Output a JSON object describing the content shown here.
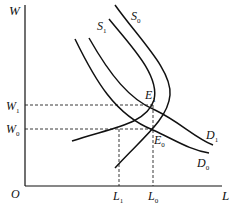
{
  "diagram": {
    "type": "supply-demand-labor-market",
    "axes": {
      "y_label": "W",
      "x_label": "L",
      "origin_label": "O"
    },
    "curves": [
      {
        "id": "S0",
        "label": "S",
        "sub": "0",
        "kind": "supply"
      },
      {
        "id": "S1",
        "label": "S",
        "sub": "1",
        "kind": "supply"
      },
      {
        "id": "D0",
        "label": "D",
        "sub": "0",
        "kind": "demand"
      },
      {
        "id": "D1",
        "label": "D",
        "sub": "1",
        "kind": "demand"
      }
    ],
    "equilibria": [
      {
        "id": "E0",
        "label": "E",
        "sub": "0"
      },
      {
        "id": "E1",
        "label": "E",
        "sub": "1"
      }
    ],
    "wage_levels": [
      {
        "id": "W0",
        "label": "W",
        "sub": "0"
      },
      {
        "id": "W1",
        "label": "W",
        "sub": "1"
      }
    ],
    "labor_levels": [
      {
        "id": "L0",
        "label": "L",
        "sub": "0"
      },
      {
        "id": "L1",
        "label": "L",
        "sub": "1"
      }
    ],
    "colors": {
      "line": "#111111",
      "background": "#ffffff"
    }
  }
}
